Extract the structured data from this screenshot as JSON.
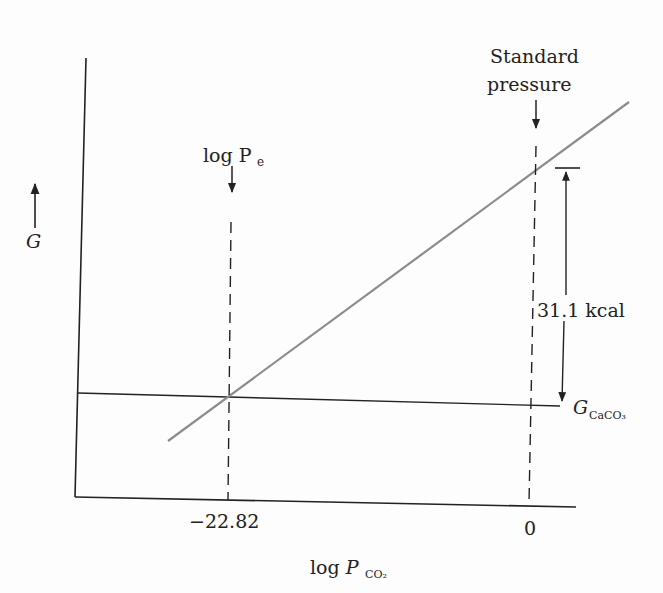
{
  "chart_data": {
    "type": "line",
    "title": "",
    "xlabel": "log P_CO2",
    "ylabel": "G",
    "x_ticks": [
      "-22.82",
      "0"
    ],
    "series": [
      {
        "name": "G_CO2 line (rising)",
        "style": "solid gray",
        "x": [
          -28.5,
          3.5
        ],
        "y_relative": "increasing"
      },
      {
        "name": "G_CaCO3",
        "style": "solid black",
        "y_relative": "nearly constant"
      }
    ],
    "annotations": [
      {
        "text": "log Pe",
        "x": -22.82,
        "arrow": "down",
        "note": "intersection of lines"
      },
      {
        "text": "Standard pressure",
        "x": 0,
        "arrow": "down"
      },
      {
        "text": "31.1 kcal",
        "note": "vertical gap between lines at log P_CO2 = 0"
      },
      {
        "text": "G_CaCO3",
        "note": "label of horizontal line"
      }
    ],
    "grid": false,
    "legend": "none"
  },
  "labels": {
    "y_axis": "G",
    "x_axis_main": "log P",
    "x_axis_sub": "CO₂",
    "pe_main": "log P",
    "pe_sub": "e",
    "std_line1": "Standard",
    "std_line2": "pressure",
    "gap": "31.1 kcal",
    "g_main": "G",
    "g_sub": "CaCO₃",
    "tick_pe": "−22.82",
    "tick_zero": "0"
  },
  "colors": {
    "ink": "#222222",
    "gray_line": "#8c8c8c"
  }
}
